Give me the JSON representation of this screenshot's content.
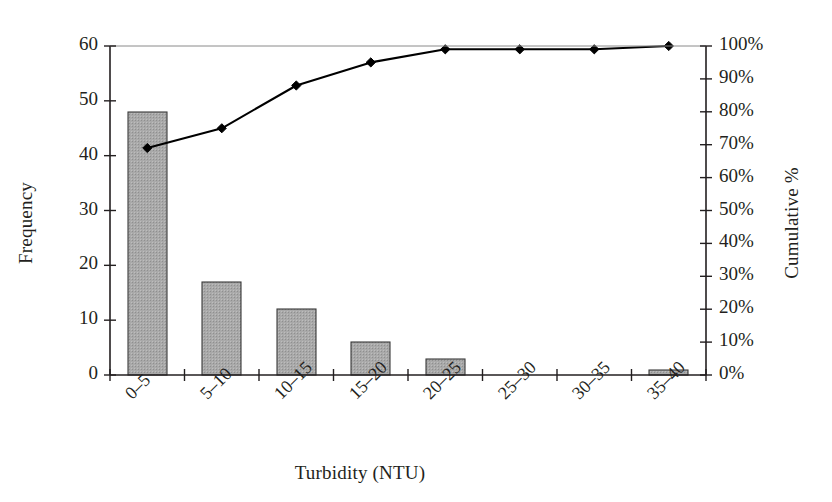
{
  "chart_data": {
    "type": "bar",
    "title": "",
    "subtitle": "",
    "xlabel": "Turbidity (NTU)",
    "ylabel": "Frequency",
    "y2label": "Cumulative %",
    "categories": [
      "0–5",
      "5–10",
      "10–15",
      "15–20",
      "20–25",
      "25–30",
      "30–35",
      "35–40"
    ],
    "series": [
      {
        "name": "Frequency",
        "kind": "bar",
        "axis": "left",
        "values": [
          48,
          17,
          12,
          6,
          3,
          0,
          0,
          1
        ]
      },
      {
        "name": "Cumulative %",
        "kind": "line",
        "axis": "right",
        "marker": "diamond",
        "values": [
          69,
          75,
          88,
          95,
          99,
          99,
          99,
          100
        ]
      }
    ],
    "ylim": [
      0,
      60
    ],
    "y2lim": [
      0,
      100
    ],
    "yticks": [
      "0",
      "10",
      "20",
      "30",
      "40",
      "50",
      "60"
    ],
    "ytick_values": [
      0,
      10,
      20,
      30,
      40,
      50,
      60
    ],
    "y2ticks": [
      "0%",
      "10%",
      "20%",
      "30%",
      "40%",
      "50%",
      "60%",
      "70%",
      "80%",
      "90%",
      "100%"
    ],
    "y2tick_values": [
      0,
      10,
      20,
      30,
      40,
      50,
      60,
      70,
      80,
      90,
      100
    ],
    "grid": false,
    "legend": "none",
    "xtick_rotation": -45,
    "colors": {
      "bar_fill": "#a9a9a9",
      "bar_edge": "#3a3a3a",
      "line": "#000000",
      "marker": "#000000",
      "axis": "#231f20",
      "text": "#231f20",
      "background": "#ffffff"
    }
  },
  "geometry": {
    "plot_left": 110,
    "plot_right": 706,
    "plot_top": 46,
    "plot_bottom": 375
  }
}
